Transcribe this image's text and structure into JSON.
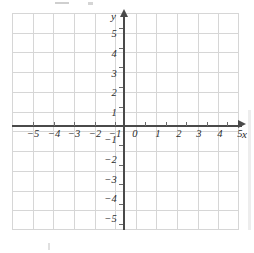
{
  "figure": {
    "type": "coordinate-grid",
    "title": "",
    "background_color": "#ffffff",
    "grid_color": "#d6d6d6",
    "axis_color": "#4a4a4a",
    "label_color": "#2b2b2b"
  },
  "axes": {
    "x": {
      "name": "x",
      "min": -5,
      "max": 5,
      "step": 1,
      "arrow": "right",
      "tick_labels": [
        "−5",
        "−4",
        "−3",
        "−2",
        "−1",
        "1",
        "2",
        "3",
        "4",
        "5"
      ]
    },
    "y": {
      "name": "y",
      "min": -5,
      "max": 5,
      "step": 1,
      "arrow": "up",
      "tick_labels_positive": [
        "5",
        "4",
        "3",
        "2",
        "1"
      ],
      "tick_labels_negative": [
        "−1",
        "−2",
        "−3",
        "−4",
        "−5"
      ]
    },
    "origin_label": "0"
  },
  "chart_data": {
    "type": "scatter",
    "title": "",
    "xlabel": "x",
    "ylabel": "y",
    "xlim": [
      -5.5,
      5.5
    ],
    "ylim": [
      -5.5,
      5.5
    ],
    "xticks": [
      -5,
      -4,
      -3,
      -2,
      -1,
      0,
      1,
      2,
      3,
      4,
      5
    ],
    "yticks": [
      -5,
      -4,
      -3,
      -2,
      -1,
      0,
      1,
      2,
      3,
      4,
      5
    ],
    "grid": true,
    "legend": null,
    "series": [],
    "annotations": [],
    "note": "Empty blank Cartesian coordinate plane; no plotted data points or curves."
  },
  "x_labels": [
    {
      "text": "−5",
      "left": 20
    },
    {
      "text": "−4",
      "left": 41
    },
    {
      "text": "−3",
      "left": 61
    },
    {
      "text": "−2",
      "left": 82
    },
    {
      "text": "−1",
      "left": 102
    },
    {
      "text": "0",
      "left": 122
    },
    {
      "text": "1",
      "left": 145
    },
    {
      "text": "2",
      "left": 166
    },
    {
      "text": "3",
      "left": 186
    },
    {
      "text": "4",
      "left": 207
    },
    {
      "text": "5",
      "left": 227
    }
  ],
  "y_labels": [
    {
      "text": "5",
      "top": 29
    },
    {
      "text": "4",
      "top": 49
    },
    {
      "text": "3",
      "top": 69
    },
    {
      "text": "2",
      "top": 88
    },
    {
      "text": "1",
      "top": 108
    },
    {
      "text": "−1",
      "top": 135
    },
    {
      "text": "−2",
      "top": 155
    },
    {
      "text": "−3",
      "top": 175
    },
    {
      "text": "−4",
      "top": 194
    },
    {
      "text": "−5",
      "top": 214
    }
  ],
  "x_ticks_pos": [
    33,
    54,
    74,
    95,
    115,
    145,
    166,
    186,
    207,
    227
  ],
  "y_ticks_pos": [
    28,
    48,
    67,
    87,
    107,
    145,
    165,
    184,
    204,
    224
  ]
}
